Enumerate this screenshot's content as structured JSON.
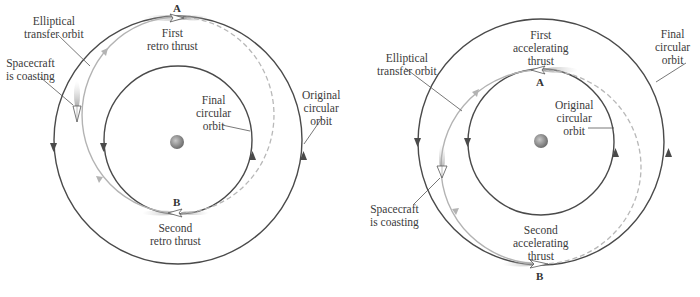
{
  "colors": {
    "orbit": "#4a4a4a",
    "transfer": "#b3b3b3",
    "planet": "#8a8a8a",
    "background": "#ffffff"
  },
  "left_diagram": {
    "title": "Transfer to lower orbit",
    "labels": {
      "elliptical": [
        "Elliptical",
        "transfer orbit"
      ],
      "coasting": [
        "Spacecraft",
        "is coasting"
      ],
      "first_thrust": [
        "First",
        "retro thrust"
      ],
      "final_orbit": [
        "Final",
        "circular",
        "orbit"
      ],
      "original_orbit": [
        "Original",
        "circular",
        "orbit"
      ],
      "second_thrust": [
        "Second",
        "retro thrust"
      ]
    },
    "points": {
      "a": "A",
      "b": "B"
    }
  },
  "right_diagram": {
    "title": "Transfer to higher orbit",
    "labels": {
      "elliptical": [
        "Elliptical",
        "transfer orbit"
      ],
      "coasting": [
        "Spacecraft",
        "is coasting"
      ],
      "first_thrust": [
        "First",
        "accelerating",
        "thrust"
      ],
      "final_orbit": [
        "Final",
        "circular",
        "orbit"
      ],
      "original_orbit": [
        "Original",
        "circular",
        "orbit"
      ],
      "second_thrust": [
        "Second",
        "accelerating",
        "thrust"
      ]
    },
    "points": {
      "a": "A",
      "b": "B"
    }
  },
  "icons": {
    "planet": "planet-icon",
    "spacecraft": "spacecraft-icon",
    "direction_arrow": "arrowhead-icon"
  }
}
